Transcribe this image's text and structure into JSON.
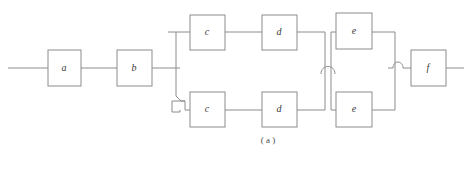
{
  "figure": {
    "type": "reliability-block-diagram",
    "caption": "( a )",
    "footnote": "",
    "stroke_color": "#8c8c8c",
    "box_fill": "#ffffff",
    "label_color": "#3a3a3a",
    "background": "#ffffff"
  },
  "blocks": [
    {
      "id": "a",
      "label": "a",
      "x": 48,
      "y": 50,
      "w": 33,
      "h": 36
    },
    {
      "id": "b",
      "label": "b",
      "x": 117,
      "y": 50,
      "w": 35,
      "h": 36
    },
    {
      "id": "c1",
      "label": "c",
      "x": 190,
      "y": 15,
      "w": 35,
      "h": 35
    },
    {
      "id": "d1",
      "label": "d",
      "x": 262,
      "y": 15,
      "w": 35,
      "h": 35
    },
    {
      "id": "e1",
      "label": "e",
      "x": 336,
      "y": 13,
      "w": 36,
      "h": 36
    },
    {
      "id": "c2",
      "label": "c",
      "x": 190,
      "y": 92,
      "w": 35,
      "h": 35
    },
    {
      "id": "d2",
      "label": "d",
      "x": 262,
      "y": 92,
      "w": 35,
      "h": 35
    },
    {
      "id": "e2",
      "label": "e",
      "x": 336,
      "y": 92,
      "w": 36,
      "h": 35
    },
    {
      "id": "f",
      "label": "f",
      "x": 411,
      "y": 50,
      "w": 35,
      "h": 36
    }
  ],
  "branches": {
    "top_row_y": 32,
    "bottom_row_y": 110,
    "main_line_y": 68,
    "split_x": 176,
    "merge_x": 395,
    "cross_x1": 325,
    "cross_x2": 331
  },
  "junctions": [
    {
      "name": "wire-jump-left",
      "kind": "square-hop",
      "x": 172,
      "y": 102
    },
    {
      "name": "wire-jump-mid",
      "kind": "arc-hop",
      "x": 328,
      "y": 68
    },
    {
      "name": "wire-jump-right",
      "kind": "arc-hop",
      "x": 398,
      "y": 68
    }
  ],
  "terminals": {
    "input_x_start": 8,
    "input_x_end": 48,
    "output_x_start": 446,
    "output_x_end": 464
  }
}
